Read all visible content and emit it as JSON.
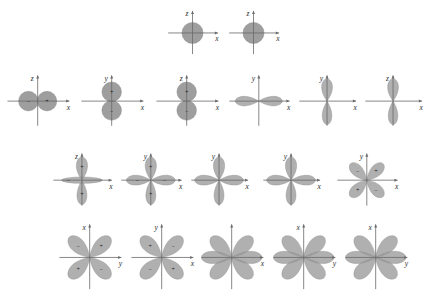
{
  "figure": {
    "background_color": "#ffffff",
    "lobe_color": "#9a9a9a",
    "axis_color": "#6a6a6a",
    "label_color": "#2b2b2b"
  },
  "axis_labels": {
    "x": "x",
    "y": "y",
    "z": "z"
  },
  "signs": {
    "plus": "+",
    "minus": "−"
  },
  "rows": [
    {
      "row_index": 0,
      "orbitals": [
        {
          "id": "r0c0",
          "shape": "s",
          "x": 167,
          "y": 8,
          "w": 58,
          "h": 48,
          "h_axis": "x",
          "v_axis": "z",
          "lobes": [
            {
              "type": "sphere",
              "sign": ""
            }
          ]
        },
        {
          "id": "r0c1",
          "shape": "s",
          "x": 228,
          "y": 8,
          "w": 58,
          "h": 48,
          "h_axis": "x",
          "v_axis": "z",
          "lobes": [
            {
              "type": "sphere",
              "sign": ""
            }
          ]
        }
      ]
    },
    {
      "row_index": 1,
      "orbitals": [
        {
          "id": "r1c0",
          "shape": "p-horizontal-round",
          "x": 6,
          "y": 72,
          "w": 72,
          "h": 56,
          "h_axis": "x",
          "v_axis": "z",
          "lobes": [
            {
              "type": "round",
              "dir": "left",
              "sign": "−"
            },
            {
              "type": "round",
              "dir": "right",
              "sign": "+"
            }
          ]
        },
        {
          "id": "r1c1",
          "shape": "p-vertical-round",
          "x": 80,
          "y": 72,
          "w": 72,
          "h": 56,
          "h_axis": "x",
          "v_axis": "y",
          "lobes": [
            {
              "type": "round",
              "dir": "up",
              "sign": "+"
            },
            {
              "type": "round",
              "dir": "down",
              "sign": "−"
            }
          ]
        },
        {
          "id": "r1c2",
          "shape": "p-vertical-round",
          "x": 155,
          "y": 72,
          "w": 72,
          "h": 56,
          "h_axis": "x",
          "v_axis": "z",
          "lobes": [
            {
              "type": "round",
              "dir": "up",
              "sign": "+"
            },
            {
              "type": "round",
              "dir": "down",
              "sign": "−"
            }
          ]
        },
        {
          "id": "r1c3",
          "shape": "p-horizontal-lobed",
          "x": 228,
          "y": 72,
          "w": 70,
          "h": 56,
          "h_axis": "x",
          "v_axis": "y",
          "lobes": [
            {
              "type": "lobe",
              "dir": "left",
              "sign": ""
            },
            {
              "type": "lobe",
              "dir": "right",
              "sign": ""
            }
          ]
        },
        {
          "id": "r1c4",
          "shape": "p-vertical-lobed",
          "x": 298,
          "y": 72,
          "w": 66,
          "h": 56,
          "h_axis": "x",
          "v_axis": "y",
          "lobes": [
            {
              "type": "lobe",
              "dir": "up",
              "sign": ""
            },
            {
              "type": "lobe",
              "dir": "down",
              "sign": ""
            }
          ]
        },
        {
          "id": "r1c5",
          "shape": "p-vertical-lobed",
          "x": 364,
          "y": 72,
          "w": 66,
          "h": 56,
          "h_axis": "x",
          "v_axis": "z",
          "lobes": [
            {
              "type": "lobe",
              "dir": "up",
              "sign": ""
            },
            {
              "type": "lobe",
              "dir": "down",
              "sign": ""
            }
          ]
        }
      ]
    },
    {
      "row_index": 2,
      "orbitals": [
        {
          "id": "r2c0",
          "shape": "dz2-like",
          "x": 52,
          "y": 150,
          "w": 68,
          "h": 58,
          "h_axis": "x",
          "v_axis": "z",
          "lobes": [
            {
              "type": "lobe",
              "dir": "up",
              "sign": "+"
            },
            {
              "type": "lobe",
              "dir": "down",
              "sign": "+"
            },
            {
              "type": "torus",
              "dir": "center",
              "sign": "−"
            }
          ]
        },
        {
          "id": "r2c1",
          "shape": "cross-four-lobe-torus",
          "x": 120,
          "y": 150,
          "w": 70,
          "h": 58,
          "h_axis": "x",
          "v_axis": "y",
          "lobes": [
            {
              "type": "lobe",
              "dir": "up",
              "sign": "+"
            },
            {
              "type": "lobe",
              "dir": "down",
              "sign": "+"
            },
            {
              "type": "lobe",
              "dir": "left",
              "sign": "−"
            },
            {
              "type": "lobe",
              "dir": "right",
              "sign": "−"
            }
          ]
        },
        {
          "id": "r2c2",
          "shape": "cross-four-lobe",
          "x": 190,
          "y": 150,
          "w": 66,
          "h": 58,
          "h_axis": "x",
          "v_axis": "y",
          "lobes": [
            {
              "type": "lobe",
              "dir": "up",
              "sign": ""
            },
            {
              "type": "lobe",
              "dir": "down",
              "sign": ""
            },
            {
              "type": "lobe",
              "dir": "left",
              "sign": ""
            },
            {
              "type": "lobe",
              "dir": "right",
              "sign": ""
            }
          ]
        },
        {
          "id": "r2c3",
          "shape": "cross-four-lobe",
          "x": 262,
          "y": 150,
          "w": 66,
          "h": 58,
          "h_axis": "x",
          "v_axis": "y",
          "lobes": [
            {
              "type": "lobe",
              "dir": "up",
              "sign": ""
            },
            {
              "type": "lobe",
              "dir": "down",
              "sign": ""
            },
            {
              "type": "lobe",
              "dir": "left",
              "sign": ""
            },
            {
              "type": "lobe",
              "dir": "right",
              "sign": ""
            }
          ]
        },
        {
          "id": "r2c4",
          "shape": "six-lobe-rosette",
          "x": 336,
          "y": 150,
          "w": 70,
          "h": 58,
          "h_axis": "x",
          "v_axis": "y",
          "lobes": [
            {
              "type": "lobe",
              "dir": "ne",
              "sign": "+"
            },
            {
              "type": "lobe",
              "dir": "nw",
              "sign": "−"
            },
            {
              "type": "lobe",
              "dir": "sw",
              "sign": "+"
            },
            {
              "type": "lobe",
              "dir": "se",
              "sign": "−"
            }
          ]
        }
      ]
    },
    {
      "row_index": 3,
      "orbitals": [
        {
          "id": "r3c0",
          "shape": "four-lobe-diagonal-signed",
          "x": 58,
          "y": 220,
          "w": 72,
          "h": 72,
          "h_axis": "y",
          "v_axis": "x",
          "lobes": [
            {
              "type": "lobe",
              "dir": "nw",
              "sign": "−"
            },
            {
              "type": "lobe",
              "dir": "ne",
              "sign": "+"
            },
            {
              "type": "lobe",
              "dir": "sw",
              "sign": "+"
            },
            {
              "type": "lobe",
              "dir": "se",
              "sign": "−"
            }
          ]
        },
        {
          "id": "r3c1",
          "shape": "four-lobe-diagonal-signed",
          "x": 130,
          "y": 220,
          "w": 72,
          "h": 72,
          "h_axis": "x",
          "v_axis": "y",
          "lobes": [
            {
              "type": "lobe",
              "dir": "nw",
              "sign": "+"
            },
            {
              "type": "lobe",
              "dir": "ne",
              "sign": "−"
            },
            {
              "type": "lobe",
              "dir": "sw",
              "sign": "−"
            },
            {
              "type": "lobe",
              "dir": "se",
              "sign": "+"
            }
          ]
        },
        {
          "id": "r3c2",
          "shape": "six-lobe-star",
          "x": 200,
          "y": 220,
          "w": 72,
          "h": 72,
          "h_axis": "x",
          "v_axis": "",
          "lobes": [
            {
              "type": "lobe",
              "dir": "nw",
              "sign": ""
            },
            {
              "type": "lobe",
              "dir": "ne",
              "sign": ""
            },
            {
              "type": "lobe",
              "dir": "sw",
              "sign": ""
            },
            {
              "type": "lobe",
              "dir": "se",
              "sign": ""
            },
            {
              "type": "lobe",
              "dir": "left",
              "sign": ""
            },
            {
              "type": "lobe",
              "dir": "right",
              "sign": ""
            }
          ]
        },
        {
          "id": "r3c3",
          "shape": "six-lobe-star",
          "x": 272,
          "y": 220,
          "w": 72,
          "h": 72,
          "h_axis": "y",
          "v_axis": "x",
          "lobes": [
            {
              "type": "lobe",
              "dir": "nw",
              "sign": ""
            },
            {
              "type": "lobe",
              "dir": "ne",
              "sign": ""
            },
            {
              "type": "lobe",
              "dir": "sw",
              "sign": ""
            },
            {
              "type": "lobe",
              "dir": "se",
              "sign": ""
            },
            {
              "type": "lobe",
              "dir": "left",
              "sign": ""
            },
            {
              "type": "lobe",
              "dir": "right",
              "sign": ""
            }
          ]
        },
        {
          "id": "r3c4",
          "shape": "six-lobe-star",
          "x": 344,
          "y": 220,
          "w": 72,
          "h": 72,
          "h_axis": "y",
          "v_axis": "x",
          "lobes": [
            {
              "type": "lobe",
              "dir": "nw",
              "sign": ""
            },
            {
              "type": "lobe",
              "dir": "ne",
              "sign": ""
            },
            {
              "type": "lobe",
              "dir": "sw",
              "sign": ""
            },
            {
              "type": "lobe",
              "dir": "se",
              "sign": ""
            },
            {
              "type": "lobe",
              "dir": "left",
              "sign": ""
            },
            {
              "type": "lobe",
              "dir": "right",
              "sign": ""
            }
          ]
        }
      ]
    }
  ]
}
